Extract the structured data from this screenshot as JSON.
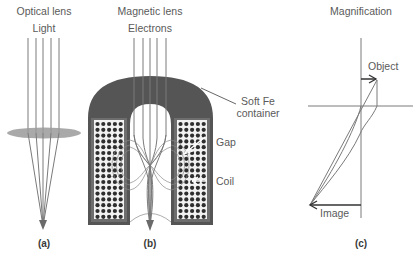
{
  "panels": {
    "a": {
      "title": "Optical lens",
      "beam_label": "Light",
      "caption": "(a)"
    },
    "b": {
      "title": "Magnetic lens",
      "beam_label": "Electrons",
      "caption": "(b)",
      "annotations": {
        "container_line1": "Soft Fe",
        "container_line2": "container",
        "gap": "Gap",
        "coil": "Coil"
      }
    },
    "c": {
      "title": "Magnification",
      "object_label": "Object",
      "image_label": "Image",
      "caption": "(c)"
    }
  },
  "colors": {
    "beam": "#7a7a7a",
    "lens": "#9a9a9a",
    "iron": "#555555",
    "coil_frame": "#6e6e6e",
    "coil_dot": "#2e2e2e",
    "field": "#8a8a8a",
    "axis": "#7a7a7a",
    "arrow": "#333333",
    "text": "#5a5a5a"
  }
}
